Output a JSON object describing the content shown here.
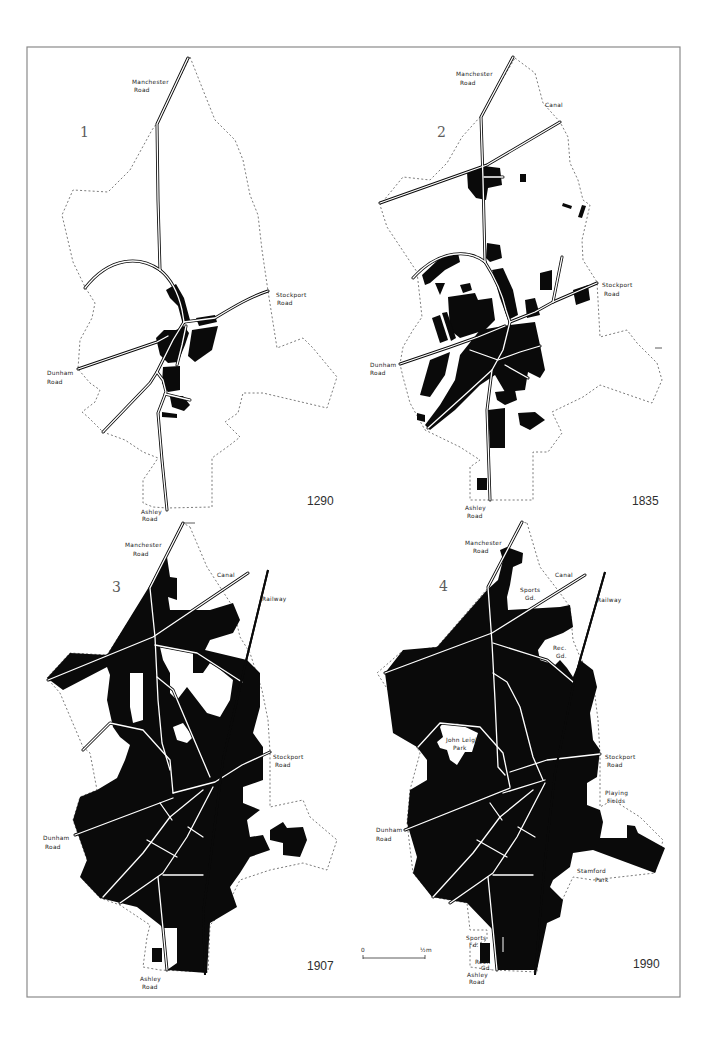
{
  "figure": {
    "panels": [
      {
        "number": "1",
        "year": "1290",
        "labels": {
          "manchester_road": [
            "Manchester",
            "Road"
          ],
          "stockport_road": [
            "Stockport",
            "Road"
          ],
          "dunham_road": [
            "Dunham",
            "Road"
          ],
          "ashley_road": [
            "Ashley",
            "Road"
          ]
        }
      },
      {
        "number": "2",
        "year": "1835",
        "labels": {
          "manchester_road": [
            "Manchester",
            "Road"
          ],
          "canal": [
            "Canal"
          ],
          "stockport_road": [
            "Stockport",
            "Road"
          ],
          "dunham_road": [
            "Dunham",
            "Road"
          ],
          "ashley_road": [
            "Ashley",
            "Road"
          ]
        }
      },
      {
        "number": "3",
        "year": "1907",
        "labels": {
          "manchester_road": [
            "Manchester",
            "Road"
          ],
          "canal": [
            "Canal"
          ],
          "railway": [
            "Railway"
          ],
          "stockport_road": [
            "Stockport",
            "Road"
          ],
          "dunham_road": [
            "Dunham",
            "Road"
          ],
          "ashley_road": [
            "Ashley",
            "Road"
          ]
        }
      },
      {
        "number": "4",
        "year": "1990",
        "labels": {
          "manchester_road": [
            "Manchester",
            "Road"
          ],
          "canal": [
            "Canal"
          ],
          "sports_ground_north": [
            "Sports",
            "Gd."
          ],
          "railway": [
            "Railway"
          ],
          "recreation_ground_north": [
            "Rec.",
            "Gd."
          ],
          "john_leigh_park": [
            "John Leigh",
            "Park"
          ],
          "stockport_road": [
            "Stockport",
            "Road"
          ],
          "playing_fields": [
            "Playing",
            "Fields"
          ],
          "stamford_park": [
            "Stamford",
            "Park"
          ],
          "dunham_road": [
            "Dunham",
            "Road"
          ],
          "sports_field_south": [
            "Sports",
            "Fd."
          ],
          "recreation_ground_south": [
            "Recn",
            "Gd."
          ],
          "ashley_road": [
            "Ashley",
            "Road"
          ]
        }
      }
    ],
    "scale_bar": {
      "start": "0",
      "end": "½m"
    }
  }
}
